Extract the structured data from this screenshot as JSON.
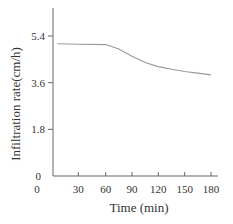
{
  "chart_data": {
    "type": "line",
    "title": "",
    "xlabel": "Time (min)",
    "ylabel": "Infiltration rate(cm/h)",
    "xlim": [
      0,
      180
    ],
    "ylim": [
      0,
      6.0
    ],
    "xticks": [
      0,
      30,
      60,
      90,
      120,
      150,
      180
    ],
    "yticks": [
      0,
      1.8,
      3.6,
      5.4
    ],
    "xtick_labels": [
      "0",
      "30",
      "60",
      "90",
      "120",
      "150",
      "180"
    ],
    "ytick_labels": [
      "0",
      "1.8",
      "3.6",
      "5.4"
    ],
    "grid": false,
    "legend": null,
    "series": [
      {
        "name": "Infiltration rate",
        "color": "#999999",
        "x": [
          5,
          30,
          60,
          75,
          90,
          105,
          120,
          135,
          150,
          165,
          180
        ],
        "y": [
          5.1,
          5.08,
          5.07,
          4.9,
          4.62,
          4.38,
          4.22,
          4.12,
          4.03,
          3.97,
          3.9
        ]
      }
    ]
  }
}
